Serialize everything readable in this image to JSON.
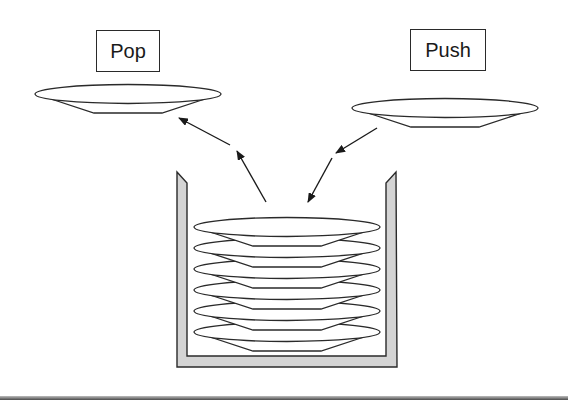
{
  "diagram": {
    "labels": {
      "pop": "Pop",
      "push": "Push"
    },
    "colors": {
      "stroke": "#2a2a2a",
      "container_fill": "#d4d4d4",
      "plate_fill": "#ffffff",
      "background": "#ffffff"
    },
    "plates_in_stack": 6,
    "loose_plates": [
      {
        "role": "popped-plate",
        "side": "left"
      },
      {
        "role": "pushed-plate",
        "side": "right"
      }
    ],
    "arrows": [
      {
        "role": "pop-arrow",
        "direction": "from stack to left plate"
      },
      {
        "role": "push-arrow",
        "direction": "from right plate to stack"
      }
    ]
  }
}
